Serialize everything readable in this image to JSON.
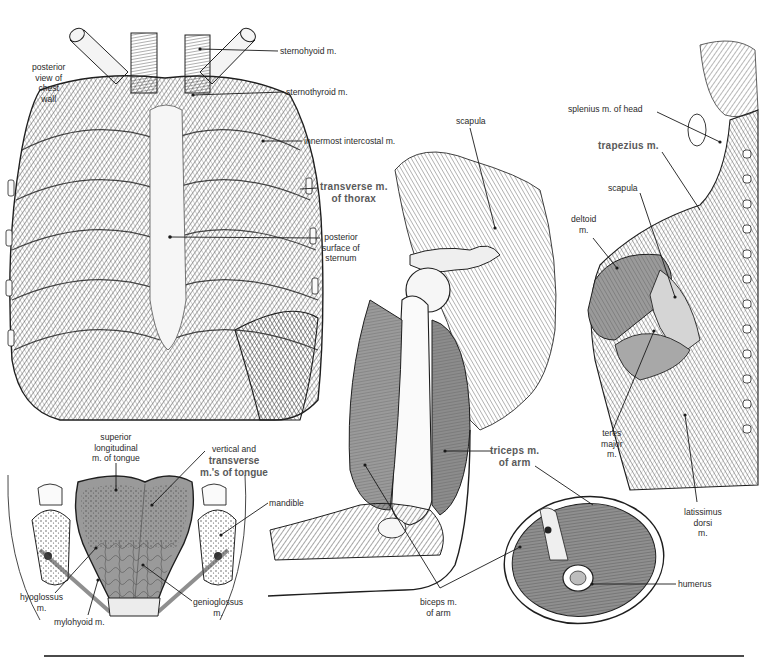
{
  "figure": {
    "panels": [
      {
        "id": "chest-wall",
        "caption": [
          "posterior",
          "view of",
          "chest",
          "wall"
        ]
      },
      {
        "id": "arm-shoulder"
      },
      {
        "id": "back-shoulder"
      },
      {
        "id": "tongue-section"
      },
      {
        "id": "arm-cross-section"
      }
    ],
    "labels": {
      "posterior_view": [
        "posterior",
        "view of",
        "chest",
        "wall"
      ],
      "sternohyoid": "sternohyoid m.",
      "sternothyroid": "sternothyroid m.",
      "innermost_intercostal": "innermost intercostal m.",
      "transverse_thorax": [
        "transverse m.",
        "of thorax"
      ],
      "posterior_sternum": [
        "posterior",
        "surface of",
        "sternum"
      ],
      "scapula_arm": "scapula",
      "splenius": "splenius m. of head",
      "trapezius": "trapezius m.",
      "scapula_back": "scapula",
      "deltoid": [
        "deltoid",
        "m."
      ],
      "teres_major": [
        "teres",
        "major",
        "m."
      ],
      "latissimus": [
        "latissimus",
        "dorsi",
        "m."
      ],
      "triceps": [
        "triceps m.",
        "of arm"
      ],
      "biceps": [
        "biceps m.",
        "of arm"
      ],
      "humerus": "humerus",
      "superior_longitudinal": [
        "superior",
        "longitudinal",
        "m. of tongue"
      ],
      "vertical_transverse": [
        "vertical and",
        "transverse",
        "m.'s of tongue"
      ],
      "mandible": "mandible",
      "hyoglossus": [
        "hyoglossus",
        "m."
      ],
      "mylohyoid": "mylohyoid m.",
      "genioglossus": [
        "genioglossus",
        "m."
      ]
    },
    "colors": {
      "ink": "#1e1e1e",
      "muscle_shade": "#8a8a8a",
      "muscle_light": "#c8c8c8",
      "bone": "#f2f2f2",
      "emphasis_label": "#5a5a5a"
    }
  }
}
